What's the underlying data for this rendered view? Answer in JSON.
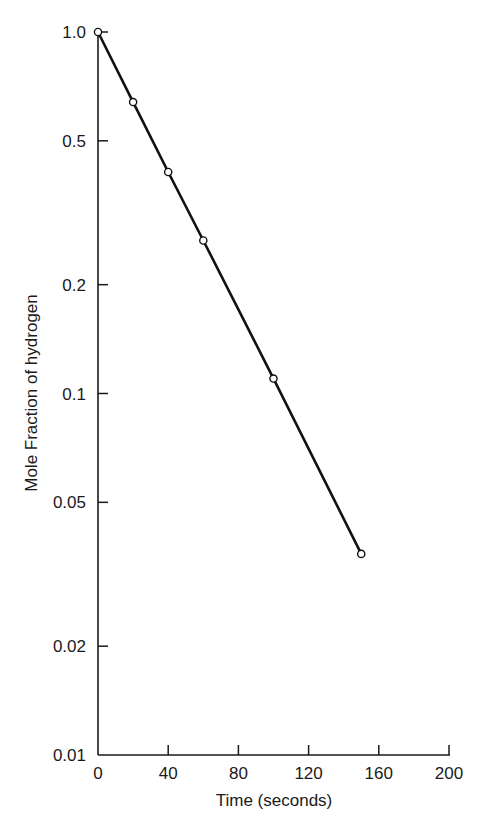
{
  "chart_data": {
    "type": "line",
    "title": "",
    "xlabel": "Time (seconds)",
    "ylabel": "Mole Fraction of hydrogen",
    "xlim": [
      0,
      200
    ],
    "ylim": [
      0.01,
      1.0
    ],
    "yscale": "log",
    "grid": false,
    "legend": null,
    "x_ticks": [
      0,
      40,
      80,
      120,
      160,
      200
    ],
    "x_tick_labels": [
      "0",
      "40",
      "80",
      "120",
      "160",
      "200"
    ],
    "y_ticks": [
      1.0,
      0.5,
      0.2,
      0.1,
      0.05,
      0.02,
      0.01
    ],
    "y_tick_labels": [
      "1.0",
      "0.5",
      "0.2",
      "0.1",
      "0.05",
      "0.02",
      "0.01"
    ],
    "series": [
      {
        "name": "hydrogen",
        "marker": "open-circle",
        "x": [
          0,
          20,
          40,
          60,
          100,
          150
        ],
        "y": [
          1.0,
          0.64,
          0.41,
          0.265,
          0.11,
          0.036
        ]
      }
    ]
  }
}
